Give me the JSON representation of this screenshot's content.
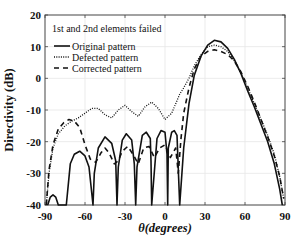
{
  "chart_data": {
    "type": "line",
    "title": "",
    "annotation": "1st and 2nd elements failed",
    "xlabel": "θ(degrees)",
    "ylabel": "Directivity (dB)",
    "xlim": [
      -90,
      90
    ],
    "ylim": [
      -40,
      20
    ],
    "xticks": [
      -90,
      -60,
      -30,
      0,
      30,
      60,
      90
    ],
    "yticks": [
      20,
      10,
      0,
      -10,
      -20,
      -30,
      -40
    ],
    "grid": true,
    "legend_position": "upper left",
    "series": [
      {
        "name": "Original pattern",
        "style": "solid",
        "x": [
          -88,
          -86,
          -84,
          -82,
          -80,
          -74,
          -71,
          -68,
          -64,
          -60,
          -57,
          -54,
          -53,
          -50,
          -45,
          -40,
          -37,
          -36,
          -35,
          -32,
          -29,
          -25,
          -23,
          -22,
          -21,
          -17,
          -14,
          -11,
          -10.5,
          -10,
          -6,
          -3,
          0,
          1.5,
          2,
          2.5,
          5,
          7,
          9,
          11,
          14,
          18,
          22,
          27,
          32,
          37,
          42,
          47,
          52,
          57,
          62,
          67,
          72,
          77,
          82,
          86,
          88
        ],
        "y": [
          -40,
          -37.5,
          -36.8,
          -37.5,
          -40,
          -40,
          -27,
          -24,
          -23,
          -24.5,
          -28,
          -40,
          -30,
          -22,
          -18.5,
          -20.5,
          -26,
          -40,
          -28,
          -19.5,
          -17.5,
          -19.5,
          -27,
          -40,
          -28,
          -18,
          -17,
          -19,
          -26,
          -40,
          -19,
          -16.5,
          -17,
          -24,
          -40,
          -22,
          -17,
          -16.5,
          -18,
          -40,
          -22,
          -8,
          1,
          7,
          10.5,
          12,
          11.5,
          9.5,
          6,
          1.5,
          -4,
          -9,
          -14.5,
          -20,
          -27,
          -35,
          -40
        ]
      },
      {
        "name": "Defected pattern",
        "style": "dotted",
        "x": [
          -89,
          -87,
          -84,
          -80,
          -75,
          -70,
          -65,
          -60,
          -55,
          -50,
          -45,
          -40,
          -35,
          -30,
          -25,
          -20,
          -15,
          -10,
          -5,
          0,
          5,
          8,
          11,
          14,
          18,
          22,
          27,
          32,
          37,
          42,
          47,
          52,
          57,
          62,
          67,
          72,
          77,
          82,
          86,
          89
        ],
        "y": [
          -40,
          -30,
          -22,
          -17.5,
          -15,
          -13.5,
          -12.5,
          -11,
          -9.5,
          -9.5,
          -11.5,
          -12.5,
          -10,
          -8.5,
          -10.5,
          -12,
          -9,
          -7.5,
          -9.5,
          -13,
          -11,
          -8,
          -5,
          -3,
          0,
          4,
          7.5,
          10,
          10.5,
          10,
          8.5,
          5.5,
          1.5,
          -3,
          -8,
          -13,
          -18,
          -24,
          -31,
          -38
        ]
      },
      {
        "name": "Corrected pattern",
        "style": "dashed",
        "x": [
          -89,
          -87,
          -84,
          -80,
          -76,
          -72,
          -68,
          -64,
          -60,
          -56,
          -52,
          -48,
          -45,
          -42,
          -38,
          -35,
          -32,
          -28,
          -24,
          -20,
          -16,
          -12,
          -8,
          -4,
          0,
          4,
          8,
          10,
          12,
          14,
          18,
          22,
          27,
          32,
          37,
          42,
          47,
          52,
          57,
          62,
          67,
          72,
          77,
          82,
          86,
          89
        ],
        "y": [
          -40,
          -29,
          -21,
          -16,
          -14,
          -13,
          -13.5,
          -15.5,
          -21,
          -25.5,
          -26.5,
          -23.5,
          -22,
          -23.5,
          -27,
          -26,
          -23,
          -21.5,
          -24,
          -27,
          -22,
          -21.5,
          -25,
          -22,
          -21,
          -25,
          -22,
          -30,
          -19,
          -11,
          -3,
          3,
          7,
          8.5,
          9,
          8.5,
          7.5,
          5.5,
          2,
          -2.5,
          -7.5,
          -13,
          -18.5,
          -24.5,
          -31,
          -38
        ]
      }
    ]
  },
  "legend": {
    "items": [
      "Original pattern",
      "Defected pattern",
      "Corrected pattern"
    ]
  },
  "colors": {
    "line": "#111111",
    "grid": "#e6e6e6",
    "axis": "#444444"
  }
}
